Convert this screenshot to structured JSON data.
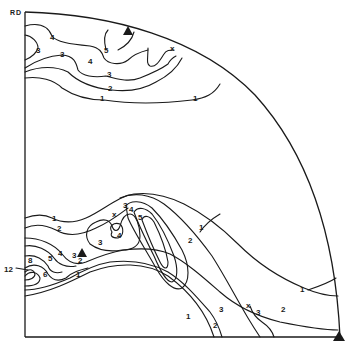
{
  "figure": {
    "type": "inverse/pole figure quadrant with intensity contours",
    "axis_label": "RD",
    "colors": {
      "ink": "#1a1a1a",
      "background": "#ffffff"
    },
    "markers": {
      "triangles": [
        {
          "name": "top-arc-triangle",
          "x": 128,
          "y": 31
        },
        {
          "name": "center-left-triangle",
          "x": 82,
          "y": 253
        },
        {
          "name": "bottom-right-corner-triangle",
          "x": 339,
          "y": 337
        }
      ],
      "crosses": [
        {
          "name": "top-arc-cross",
          "x": 173,
          "y": 48
        },
        {
          "name": "center-cross",
          "x": 115,
          "y": 214
        },
        {
          "name": "bottom-right-cross",
          "x": 249,
          "y": 305
        }
      ]
    },
    "contour_labels": [
      {
        "text": "4",
        "x": 50,
        "y": 40
      },
      {
        "text": "3",
        "x": 37,
        "y": 51
      },
      {
        "text": "3",
        "x": 61,
        "y": 55
      },
      {
        "text": "5",
        "x": 106,
        "y": 51
      },
      {
        "text": "4",
        "x": 89,
        "y": 62
      },
      {
        "text": "3",
        "x": 108,
        "y": 75
      },
      {
        "text": "2",
        "x": 110,
        "y": 89
      },
      {
        "text": "1",
        "x": 100,
        "y": 98
      },
      {
        "text": "1",
        "x": 194,
        "y": 99
      },
      {
        "text": "1",
        "x": 52,
        "y": 219
      },
      {
        "text": "2",
        "x": 58,
        "y": 229
      },
      {
        "text": "3",
        "x": 126,
        "y": 207
      },
      {
        "text": "4",
        "x": 130,
        "y": 211
      },
      {
        "text": "5",
        "x": 140,
        "y": 219
      },
      {
        "text": "4",
        "x": 118,
        "y": 237
      },
      {
        "text": "3",
        "x": 99,
        "y": 243
      },
      {
        "text": "1",
        "x": 200,
        "y": 226
      },
      {
        "text": "2",
        "x": 189,
        "y": 240
      },
      {
        "text": "4",
        "x": 60,
        "y": 254
      },
      {
        "text": "5",
        "x": 49,
        "y": 260
      },
      {
        "text": "3",
        "x": 74,
        "y": 258
      },
      {
        "text": "2",
        "x": 82,
        "y": 262
      },
      {
        "text": "8",
        "x": 30,
        "y": 262
      },
      {
        "text": "12",
        "x": 4,
        "y": 271
      },
      {
        "text": "6",
        "x": 44,
        "y": 276
      },
      {
        "text": "1",
        "x": 76,
        "y": 275
      },
      {
        "text": "1",
        "x": 300,
        "y": 290
      },
      {
        "text": "2",
        "x": 281,
        "y": 310
      },
      {
        "text": "3",
        "x": 258,
        "y": 314
      },
      {
        "text": "3",
        "x": 220,
        "y": 310
      },
      {
        "text": "2",
        "x": 214,
        "y": 327
      },
      {
        "text": "1",
        "x": 186,
        "y": 317
      },
      {
        "text": "2",
        "x": 78,
        "y": 264
      }
    ]
  }
}
